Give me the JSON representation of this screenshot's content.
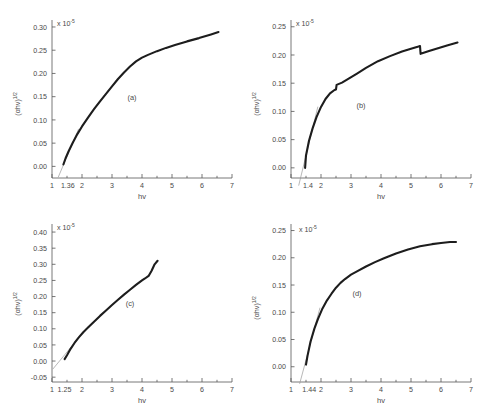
{
  "figure": {
    "name": "tauc-plot-four-panels",
    "background": "#ffffff",
    "curve_color": "#1d1d1d",
    "fit_color": "#9a9a9a",
    "axis_color": "#555555"
  },
  "chart_data": [
    {
      "type": "line",
      "panel": "(a)",
      "title": "",
      "xlabel": "hv",
      "ylabel": "(αhv)",
      "ylabel_exponent": "1/2",
      "y_scale_note": "x 10",
      "y_scale_exponent": "-5",
      "xlim": [
        1,
        7
      ],
      "ylim": [
        -0.025,
        0.315
      ],
      "xticks": [
        1,
        2,
        3,
        4,
        5,
        6,
        7
      ],
      "xticklabels": [
        "1",
        "2",
        "3",
        "4",
        "5",
        "6",
        "7"
      ],
      "yticks": [
        0.0,
        0.05,
        0.1,
        0.15,
        0.2,
        0.25,
        0.3
      ],
      "yticklabels": [
        "0.00",
        "0.05",
        "0.10",
        "0.15",
        "0.20",
        "0.25",
        "0.30"
      ],
      "intercept": 1.36,
      "intercept_label": "1.36",
      "grid": false,
      "legend": "none",
      "x": [
        1.38,
        1.45,
        1.55,
        1.7,
        1.85,
        2.0,
        2.2,
        2.4,
        2.6,
        2.8,
        3.0,
        3.2,
        3.4,
        3.6,
        3.8,
        4.0,
        4.2,
        4.5,
        4.8,
        5.1,
        5.5,
        5.9,
        6.3,
        6.55
      ],
      "y": [
        0.004,
        0.017,
        0.032,
        0.052,
        0.07,
        0.086,
        0.105,
        0.123,
        0.14,
        0.156,
        0.172,
        0.188,
        0.202,
        0.215,
        0.226,
        0.234,
        0.24,
        0.248,
        0.255,
        0.261,
        0.269,
        0.276,
        0.284,
        0.289
      ]
    },
    {
      "type": "line",
      "panel": "(b)",
      "title": "",
      "xlabel": "hv",
      "ylabel": "(αhv)",
      "ylabel_exponent": "1/2",
      "y_scale_note": "x 10",
      "y_scale_exponent": "-5",
      "xlim": [
        1,
        7
      ],
      "ylim": [
        -0.018,
        0.262
      ],
      "xticks": [
        1,
        2,
        3,
        4,
        5,
        6,
        7
      ],
      "xticklabels": [
        "1",
        "2",
        "3",
        "4",
        "5",
        "6",
        "7"
      ],
      "yticks": [
        0.0,
        0.05,
        0.1,
        0.15,
        0.2,
        0.25
      ],
      "yticklabels": [
        "0.00",
        "0.05",
        "0.10",
        "0.15",
        "0.20",
        "0.25"
      ],
      "intercept": 1.4,
      "intercept_label": "1.4",
      "grid": false,
      "legend": "none",
      "x": [
        1.47,
        1.5,
        1.6,
        1.72,
        1.85,
        2.0,
        2.15,
        2.3,
        2.45,
        2.5,
        2.52,
        2.7,
        2.95,
        3.2,
        3.5,
        3.9,
        4.3,
        4.7,
        5.0,
        5.25,
        5.3,
        5.32,
        5.6,
        5.9,
        6.2,
        6.55
      ],
      "y": [
        0.0,
        0.022,
        0.048,
        0.07,
        0.09,
        0.108,
        0.122,
        0.132,
        0.138,
        0.139,
        0.147,
        0.151,
        0.159,
        0.167,
        0.177,
        0.189,
        0.198,
        0.206,
        0.211,
        0.215,
        0.216,
        0.202,
        0.207,
        0.212,
        0.217,
        0.222
      ]
    },
    {
      "type": "line",
      "panel": "(c)",
      "title": "",
      "xlabel": "hv",
      "ylabel": "(αhv)",
      "ylabel_exponent": "1/2",
      "y_scale_note": "x 10",
      "y_scale_exponent": "-5",
      "xlim": [
        1,
        7
      ],
      "ylim": [
        -0.065,
        0.425
      ],
      "xticks": [
        1,
        2,
        3,
        4,
        5,
        6,
        7
      ],
      "xticklabels": [
        "1",
        "2",
        "3",
        "4",
        "5",
        "6",
        "7"
      ],
      "yticks": [
        -0.05,
        0.0,
        0.05,
        0.1,
        0.15,
        0.2,
        0.25,
        0.3,
        0.35,
        0.4
      ],
      "yticklabels": [
        "-0.05",
        "0.00",
        "0.05",
        "0.10",
        "0.15",
        "0.20",
        "0.25",
        "0.30",
        "0.35",
        "0.40"
      ],
      "intercept": 1.25,
      "intercept_label": "1.25",
      "grid": false,
      "legend": "none",
      "x": [
        1.42,
        1.5,
        1.62,
        1.75,
        1.9,
        2.05,
        2.2,
        2.4,
        2.6,
        2.8,
        3.0,
        3.2,
        3.4,
        3.6,
        3.8,
        4.0,
        4.1,
        4.22,
        4.32,
        4.42,
        4.52
      ],
      "y": [
        0.006,
        0.018,
        0.038,
        0.056,
        0.074,
        0.09,
        0.104,
        0.122,
        0.14,
        0.157,
        0.174,
        0.19,
        0.206,
        0.221,
        0.236,
        0.25,
        0.256,
        0.264,
        0.28,
        0.3,
        0.311
      ]
    },
    {
      "type": "line",
      "panel": "(d)",
      "title": "",
      "xlabel": "hv",
      "ylabel": "(αhv)",
      "ylabel_exponent": "1/2",
      "y_scale_note": "x 10",
      "y_scale_exponent": "-5",
      "xlim": [
        1,
        7
      ],
      "ylim": [
        -0.028,
        0.262
      ],
      "xticks": [
        1,
        2,
        3,
        4,
        5,
        6,
        7
      ],
      "xticklabels": [
        "1",
        "2",
        "3",
        "4",
        "5",
        "6",
        "7"
      ],
      "yticks": [
        0.0,
        0.05,
        0.1,
        0.15,
        0.2,
        0.25
      ],
      "yticklabels": [
        "0.00",
        "0.05",
        "0.10",
        "0.15",
        "0.20",
        "0.25"
      ],
      "intercept": 1.44,
      "intercept_label": "1.44",
      "grid": false,
      "legend": "none",
      "x": [
        1.5,
        1.55,
        1.65,
        1.78,
        1.9,
        2.05,
        2.2,
        2.35,
        2.5,
        2.65,
        2.8,
        3.0,
        3.2,
        3.5,
        3.8,
        4.1,
        4.5,
        4.9,
        5.3,
        5.7,
        6.0,
        6.3,
        6.5
      ],
      "y": [
        0.004,
        0.02,
        0.046,
        0.07,
        0.088,
        0.107,
        0.122,
        0.134,
        0.145,
        0.154,
        0.161,
        0.169,
        0.175,
        0.184,
        0.192,
        0.199,
        0.208,
        0.215,
        0.221,
        0.225,
        0.227,
        0.229,
        0.229
      ]
    }
  ]
}
